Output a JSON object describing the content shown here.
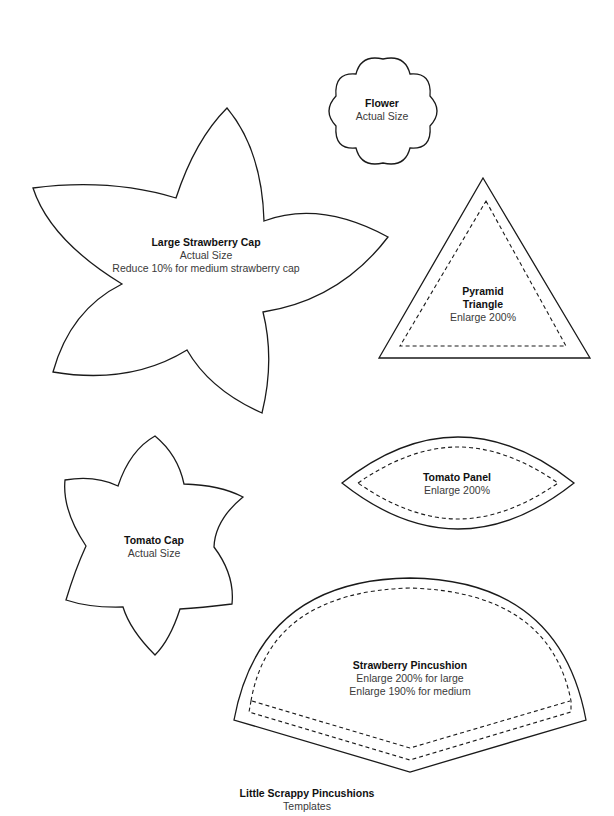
{
  "document": {
    "title": "Little Scrappy Pincushions",
    "subtitle": "Templates"
  },
  "templates": {
    "flower": {
      "name": "Flower",
      "notes": [
        "Actual Size"
      ]
    },
    "large_strawberry_cap": {
      "name": "Large Strawberry Cap",
      "notes": [
        "Actual Size",
        "Reduce 10% for medium strawberry cap"
      ]
    },
    "pyramid_triangle": {
      "name_lines": [
        "Pyramid",
        "Triangle"
      ],
      "notes": [
        "Enlarge 200%"
      ]
    },
    "tomato_panel": {
      "name": "Tomato Panel",
      "notes": [
        "Enlarge 200%"
      ]
    },
    "tomato_cap": {
      "name": "Tomato Cap",
      "notes": [
        "Actual Size"
      ]
    },
    "strawberry_pincushion": {
      "name": "Strawberry Pincushion",
      "notes": [
        "Enlarge 200% for large",
        "Enlarge 190% for medium"
      ]
    }
  }
}
